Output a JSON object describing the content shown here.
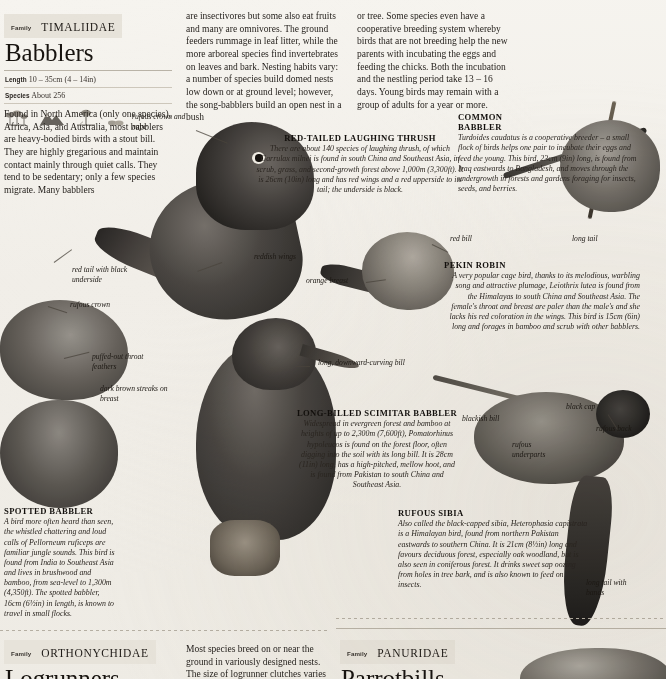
{
  "page": {
    "background_color": "#f2efe9",
    "text_color": "#1d1914"
  },
  "sections": {
    "babblers": {
      "family_label": "Family",
      "family_name": "TIMALIIDAE",
      "title": "Babblers",
      "stats": [
        {
          "label": "Length",
          "value": "10 – 35cm (4 – 14in)"
        },
        {
          "label": "Species",
          "value": "About 256"
        }
      ],
      "intro": "Found in North America (only one species), Africa, Asia, and Australia, most babblers are heavy-bodied birds with a stout bill. They are highly gregarious and maintain contact mainly through quiet calls. They tend to be sedentary; only a few species migrate. Many babblers",
      "column2": "are insectivores but some also eat fruits and many are omnivores. The ground feeders rummage in leaf litter, while the more arboreal species find invertebrates on leaves and bark. Nesting habits vary: a number of species build domed nests low down or at ground level; however, the song-babblers build an open nest in a bush",
      "column3": "or tree. Some species even have a cooperative breeding system whereby birds that are not breeding help the new parents with incubating the eggs and feeding the chicks. Both the incubation and the nestling period take 13 – 16 days. Young birds may remain with a group of adults for a year or more."
    },
    "logrunners": {
      "family_label": "Family",
      "family_name": "ORTHONYCHIDAE",
      "title": "Logrunners",
      "text": "Most species breed on or near the ground in variously designed nests. The size of logrunner clutches varies between 1 and 3. Many birds"
    },
    "parrotbills": {
      "family_label": "Family",
      "family_name": "PANURIDAE",
      "title": "Parrotbills"
    }
  },
  "species": [
    {
      "id": "red-tailed-laughing-thrush",
      "name": "RED-TAILED LAUGHING THRUSH",
      "text": "There are about 140 species of laughing thrush, of which Garrulax milnei is found in south China and Southeast Asia, in scrub, grass, and second-growth forest above 1,000m (3,300ft). It is 26cm (10in) long and has red wings and a red upperside to its tail; the underside is black."
    },
    {
      "id": "common-babbler",
      "name": "COMMON BABBLER",
      "text": "Turdoides caudatus is a cooperative breeder – a small flock of birds helps one pair to incubate their eggs and feed the young. This bird, 23cm (9in) long, is found from Iraq eastwards to Bangladesh, and moves through the undergrowth in forests and gardens foraging for insects, seeds, and berries."
    },
    {
      "id": "pekin-robin",
      "name": "PEKIN ROBIN",
      "text": "A very popular cage bird, thanks to its melodious, warbling song and attractive plumage, Leiothrix lutea is found from the Himalayas to south China and Southeast Asia. The female's throat and breast are paler than the male's and she lacks his red coloration in the wings. This bird is 15cm (6in) long and forages in bamboo and scrub with other babblers."
    },
    {
      "id": "long-billed-scimitar-babbler",
      "name": "LONG-BILLED SCIMITAR BABBLER",
      "text": "Widespread in evergreen forest and bamboo at heights of up to 2,300m (7,600ft), Pomatorhinus hypoleucos is found on the forest floor, often digging into the soil with its long bill. It is 28cm (11in) long, has a high-pitched, mellow hoot, and is found from Pakistan to south China and Southeast Asia."
    },
    {
      "id": "spotted-babbler",
      "name": "SPOTTED BABBLER",
      "text": "A bird more often heard than seen, the whistled chattering and loud calls of Pellorneum ruficeps are familiar jungle sounds. This bird is found from India to Southeast Asia and lives in brushwood and bamboo, from sea-level to 1,300m (4,350ft). The spotted babbler, 16cm (6½in) in length, is known to travel in small flocks."
    },
    {
      "id": "rufous-sibia",
      "name": "RUFOUS SIBIA",
      "text": "Also called the black-capped sibia, Heterophasia capistrata is a Himalayan bird, found from northern Pakistan eastwards to southern China. It is 21cm (8½in) long and favours deciduous forest, especially oak woodland, but is also seen in coniferous forest. It drinks sweet sap oozing from holes in tree bark, and is also known to feed on insects."
    }
  ],
  "annotations": [
    {
      "id": "rufous-crown-and-nape",
      "text": "rufous crown and nape"
    },
    {
      "id": "reddish-wings",
      "text": "reddish wings"
    },
    {
      "id": "red-tail-with-black-underside",
      "text": "red tail with black underside"
    },
    {
      "id": "rufous-crown",
      "text": "rufous crown"
    },
    {
      "id": "puffed-out-throat-feathers",
      "text": "puffed-out throat feathers"
    },
    {
      "id": "dark-brown-streaks-on-breast",
      "text": "dark brown streaks on breast"
    },
    {
      "id": "orange-breast",
      "text": "orange breast"
    },
    {
      "id": "red-bill",
      "text": "red bill"
    },
    {
      "id": "long-tail",
      "text": "long tail"
    },
    {
      "id": "long-downward-curving-bill",
      "text": "long, downward-curving bill"
    },
    {
      "id": "blackish-bill",
      "text": "blackish bill"
    },
    {
      "id": "black-cap",
      "text": "black cap"
    },
    {
      "id": "rufous-back",
      "text": "rufous back"
    },
    {
      "id": "rufous-underparts",
      "text": "rufous underparts"
    },
    {
      "id": "long-tail-with-bands",
      "text": "long tail with bands"
    }
  ],
  "habitat_icons": [
    {
      "id": "forest-icon",
      "name": "forest-habitat-icon"
    },
    {
      "id": "mountain-icon",
      "name": "mountain-habitat-icon"
    },
    {
      "id": "tree-icon",
      "name": "tree-habitat-icon"
    },
    {
      "id": "scrub-icon",
      "name": "scrub-habitat-icon"
    }
  ]
}
